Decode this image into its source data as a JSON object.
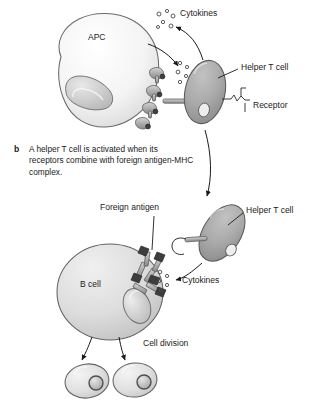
{
  "figure": {
    "panel_letter": "b",
    "caption": "A helper T cell is activated when its receptors combine with foreign antigen-MHC complex.",
    "labels": {
      "cytokines_top": "Cytokines",
      "cytokines_bottom": "Cytokines",
      "helper_t_cell_top": "Helper T cell",
      "helper_t_cell_bottom": "Helper T cell",
      "receptor": "Receptor",
      "foreign_antigen": "Foreign antigen",
      "cell_division": "Cell division",
      "apc": "APC",
      "b_cell": "B cell"
    },
    "colors": {
      "ink": "#1a1a1a",
      "outline": "#555555",
      "apc_fill": "#f2f2f2",
      "apc_shade": "#e2e2e2",
      "nucleus_fill": "#cfcfcf",
      "tcell_fill": "#a9a9a9",
      "tcell_shade": "#949494",
      "bcell_fill": "#dcdcdc",
      "bcell_shade": "#c9c9c9",
      "receptor_fill": "#bdbdbd",
      "antigen_tip": "#3a3a3a",
      "background": "#ffffff"
    },
    "structures": {
      "apc": "antigen-presenting-cell",
      "mhc_complexes": "mhc-antigen-complexes",
      "helper_t_cell": "helper-t-lymphocyte",
      "t_cell_receptor": "t-cell-receptor",
      "cytokine_particles": "cytokine-molecules",
      "b_cell": "b-lymphocyte",
      "b_cell_receptors": "membrane-bound-antibody-receptors",
      "daughter_cells": "daughter-cells"
    }
  }
}
